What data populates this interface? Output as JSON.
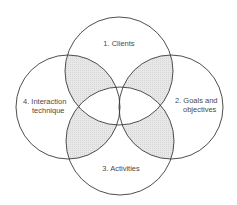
{
  "diagram": {
    "type": "four-circle venn diagram",
    "colors": {
      "background": "#ffffff",
      "stroke": "#3a3a3a",
      "text": "#4a4a4a",
      "pairwise_overlap_fill": "#e6e6e6",
      "central_hatch": "#555555"
    },
    "circles": [
      {
        "id": "clients",
        "label": "1. Clients",
        "cx": 119,
        "cy": 71,
        "r": 54
      },
      {
        "id": "goals",
        "label_lines": [
          "2. Goals and",
          "objectives"
        ],
        "cx": 171,
        "cy": 107,
        "r": 52
      },
      {
        "id": "activities",
        "label": "3. Activities",
        "cx": 120,
        "cy": 141,
        "r": 54
      },
      {
        "id": "interaction",
        "label_lines": [
          "4. Interaction",
          "technique"
        ],
        "cx": 68,
        "cy": 107,
        "r": 52
      }
    ],
    "shaded_regions": [
      "clients∩interaction",
      "clients∩goals",
      "activities∩interaction",
      "activities∩goals"
    ],
    "hatched_region": "left∩right lens (center)"
  }
}
